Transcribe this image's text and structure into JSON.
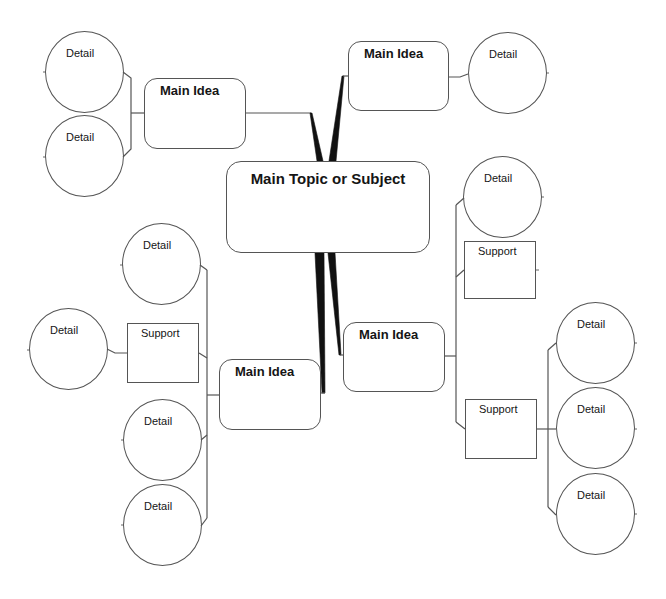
{
  "colors": {
    "background": "#ffffff",
    "stroke": "#555555",
    "wedge": "#111111",
    "text": "#151515"
  },
  "center": {
    "label": "Main Topic or Subject"
  },
  "branches": {
    "top_left": {
      "main_idea": "Main Idea",
      "details": [
        "Detail",
        "Detail"
      ]
    },
    "top_right": {
      "main_idea": "Main Idea",
      "details": [
        "Detail"
      ]
    },
    "bottom_left": {
      "main_idea": "Main Idea",
      "details": [
        "Detail",
        "Detail",
        "Detail"
      ],
      "supports": [
        {
          "label": "Support",
          "details": [
            "Detail"
          ]
        }
      ]
    },
    "bottom_right": {
      "main_idea": "Main Idea",
      "details": [
        "Detail"
      ],
      "supports": [
        {
          "label": "Support",
          "details": []
        },
        {
          "label": "Support",
          "details": [
            "Detail",
            "Detail",
            "Detail"
          ]
        }
      ]
    }
  }
}
